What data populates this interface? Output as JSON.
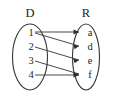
{
  "diagram": {
    "type": "mapping-diagram",
    "title": "",
    "domain_set": {
      "label": "D",
      "elements": [
        "1",
        "2",
        "3",
        "4"
      ]
    },
    "range_set": {
      "label": "R",
      "elements": [
        "a",
        "d",
        "e",
        "f"
      ]
    },
    "arrows": [
      {
        "from": "1",
        "to": "a"
      },
      {
        "from": "1",
        "to": "d"
      },
      {
        "from": "2",
        "to": "e"
      },
      {
        "from": "3",
        "to": "f"
      },
      {
        "from": "4",
        "to": "f"
      }
    ],
    "colors": {
      "stroke": "#3a3a3a",
      "text": "#1d1d1d",
      "background": "#ffffff"
    }
  }
}
